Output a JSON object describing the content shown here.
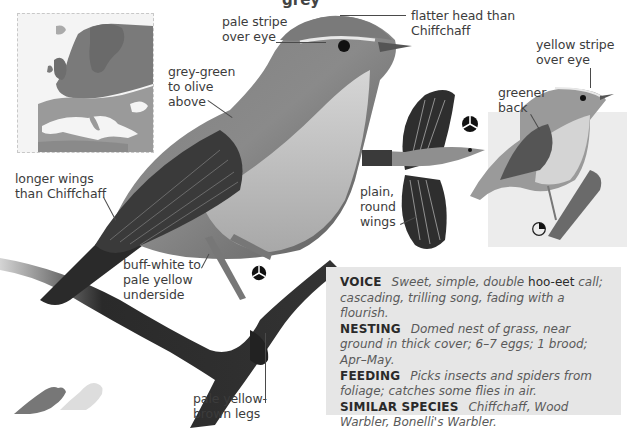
{
  "page": {
    "top_fragment": "grey"
  },
  "map": {
    "caption": "Europe range map"
  },
  "main_illustration": {
    "labels": {
      "pale_stripe": [
        "pale stripe",
        "over eye"
      ],
      "flatter_head": [
        "flatter head than",
        "Chiffchaff"
      ],
      "grey_green": [
        "grey-green",
        "to olive",
        "above"
      ],
      "longer_wings": [
        "longer wings",
        "than Chiffchaff"
      ],
      "buff_white": [
        "buff-white to",
        "pale yellow",
        "underside"
      ],
      "legs": [
        "pale yellow-",
        "brown legs"
      ]
    }
  },
  "flight_illustration": {
    "labels": {
      "round_wings": [
        "plain,",
        "round",
        "wings"
      ]
    }
  },
  "juvenile_illustration": {
    "labels": {
      "yellow_stripe": [
        "yellow stripe",
        "over eye"
      ],
      "greener_back": [
        "greener",
        "back"
      ]
    }
  },
  "symbols": {
    "male_female_symbol_main": "tri-segment circle",
    "male_female_symbol_flight": "tri-segment circle",
    "juvenile_symbol": "quarter-filled circle"
  },
  "info": {
    "voice": {
      "key": "VOICE",
      "text_a": "Sweet, simple, double",
      "call": "hoo-eet",
      "text_b": "call; cascading, trilling song, fading with a flourish."
    },
    "nesting": {
      "key": "NESTING",
      "text": "Domed nest of grass, near ground in thick cover; 6–7 eggs; 1 brood; Apr–May."
    },
    "feeding": {
      "key": "FEEDING",
      "text": "Picks insects and spiders from foliage; catches some flies in air."
    },
    "similar": {
      "key": "SIMILAR SPECIES",
      "text": "Chiffchaff, Wood Warbler, Bonelli's Warbler."
    }
  },
  "size_comparison": {
    "caption": "size silhouettes"
  }
}
